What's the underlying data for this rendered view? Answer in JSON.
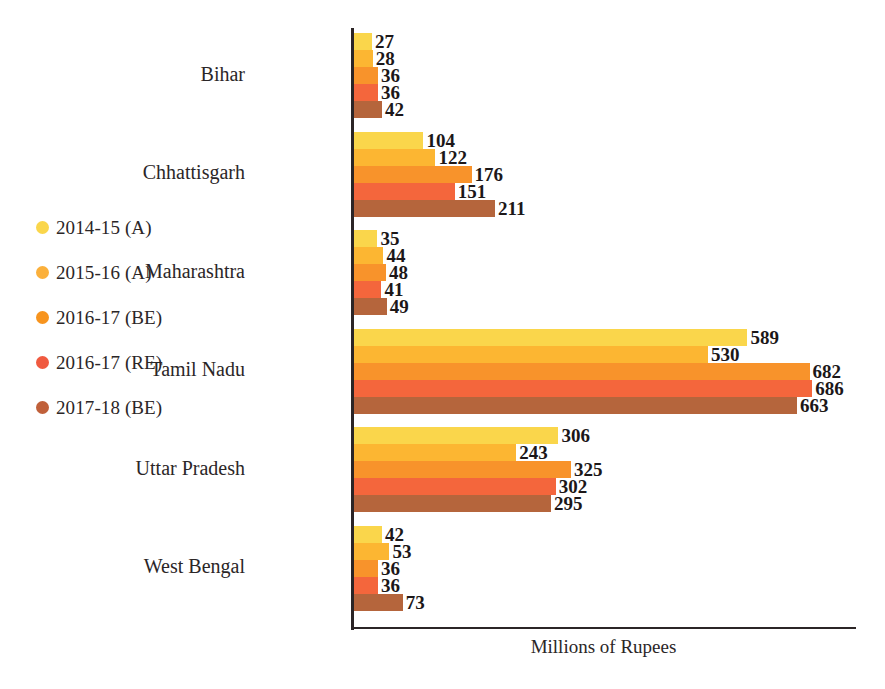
{
  "chart_data": {
    "type": "bar",
    "orientation": "horizontal",
    "title": "",
    "xlabel": "Millions of Rupees",
    "ylabel": "",
    "grid": false,
    "legend_position": "left",
    "categories": [
      "Bihar",
      "Chhattisgarh",
      "Maharashtra",
      "Tamil Nadu",
      "Uttar Pradesh",
      "West Bengal"
    ],
    "series": [
      {
        "name": "2014-15 (A)",
        "color": "#fad64b",
        "values": [
          27,
          104,
          35,
          589,
          306,
          42
        ]
      },
      {
        "name": "2015-16 (A)",
        "color": "#fcb632",
        "values": [
          28,
          122,
          44,
          530,
          243,
          53
        ]
      },
      {
        "name": "2016-17 (BE)",
        "color": "#f8932b",
        "values": [
          36,
          176,
          48,
          682,
          325,
          36
        ]
      },
      {
        "name": "2016-17 (RE)",
        "color": "#f4663c",
        "values": [
          36,
          151,
          41,
          686,
          302,
          36
        ]
      },
      {
        "name": "2017-18 (BE)",
        "color": "#b5653c",
        "values": [
          42,
          211,
          49,
          663,
          295,
          73
        ]
      }
    ],
    "xlim": [
      0,
      700
    ],
    "max_value": 686,
    "units": "Millions of Rupees"
  },
  "legend": {
    "items": [
      {
        "label": "2014-15 (A)",
        "color": "#fad64b"
      },
      {
        "label": "2015-16 (A)",
        "color": "#fbb03b"
      },
      {
        "label": "2016-17 (BE)",
        "color": "#f7941e"
      },
      {
        "label": "2016-17 (RE)",
        "color": "#f05a40"
      },
      {
        "label": "2017-18 (BE)",
        "color": "#c0603a"
      }
    ]
  },
  "axis": {
    "x_label": "Millions of Rupees"
  }
}
